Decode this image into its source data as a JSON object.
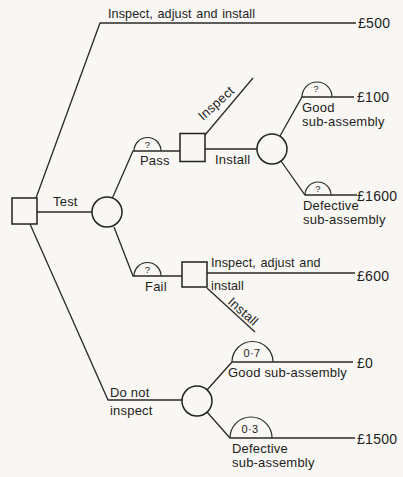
{
  "palette": {
    "background": "#f8f7f4",
    "ink": "#2b2a28"
  },
  "tree": {
    "root": {
      "node_type": "decision-square",
      "branches": {
        "inspect_adjust_install": {
          "label": "Inspect, adjust and install",
          "payoff": "£500"
        },
        "test": {
          "label": "Test"
        },
        "do_not_inspect": {
          "label_line1": "Do not",
          "label_line2": "inspect"
        }
      }
    },
    "test_outcome": {
      "node_type": "chance-circle",
      "pass": {
        "probability": "?",
        "label": "Pass"
      },
      "fail": {
        "probability": "?",
        "label": "Fail"
      }
    },
    "after_pass": {
      "node_type": "decision-square",
      "inspect": {
        "label": "Inspect"
      },
      "install": {
        "label": "Install"
      }
    },
    "after_pass_install": {
      "node_type": "chance-circle",
      "good": {
        "probability": "?",
        "label_line1": "Good",
        "label_line2": "sub-assembly",
        "payoff": "£100"
      },
      "defective": {
        "probability": "?",
        "label_line1": "Defective",
        "label_line2": "sub-assembly",
        "payoff": "£1600"
      }
    },
    "after_fail": {
      "node_type": "decision-square",
      "inspect_adjust_install": {
        "label_line1": "Inspect, adjust and",
        "label_line2": "install",
        "payoff": "£600"
      },
      "install": {
        "label": "Install"
      }
    },
    "no_inspect_outcome": {
      "node_type": "chance-circle",
      "good": {
        "probability": "0·7",
        "label": "Good sub-assembly",
        "payoff": "£0"
      },
      "defective": {
        "probability": "0·3",
        "label_line1": "Defective",
        "label_line2": "sub-assembly",
        "payoff": "£1500"
      }
    }
  }
}
